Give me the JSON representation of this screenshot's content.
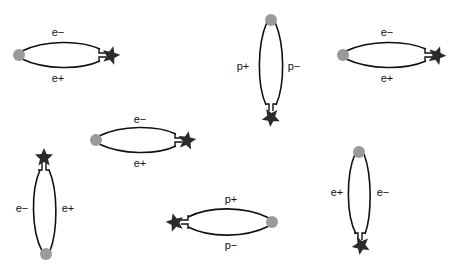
{
  "diagram": {
    "colors": {
      "line": "#111111",
      "dot": "#9a9a9a",
      "star": "#2b2b2b",
      "background": "#ffffff"
    },
    "loops": [
      {
        "id": "loop-1",
        "orientation": "horizontal",
        "label_a": "e−",
        "label_b": "e+"
      },
      {
        "id": "loop-2",
        "orientation": "vertical",
        "label_a": "p+",
        "label_b": "p−"
      },
      {
        "id": "loop-3",
        "orientation": "horizontal",
        "label_a": "e−",
        "label_b": "e+"
      },
      {
        "id": "loop-4",
        "orientation": "horizontal",
        "label_a": "e−",
        "label_b": "e+"
      },
      {
        "id": "loop-5",
        "orientation": "vertical",
        "label_a": "e−",
        "label_b": "e+"
      },
      {
        "id": "loop-6",
        "orientation": "horizontal",
        "label_a": "p+",
        "label_b": "p−"
      },
      {
        "id": "loop-7",
        "orientation": "vertical",
        "label_a": "e+",
        "label_b": "e−"
      }
    ]
  }
}
